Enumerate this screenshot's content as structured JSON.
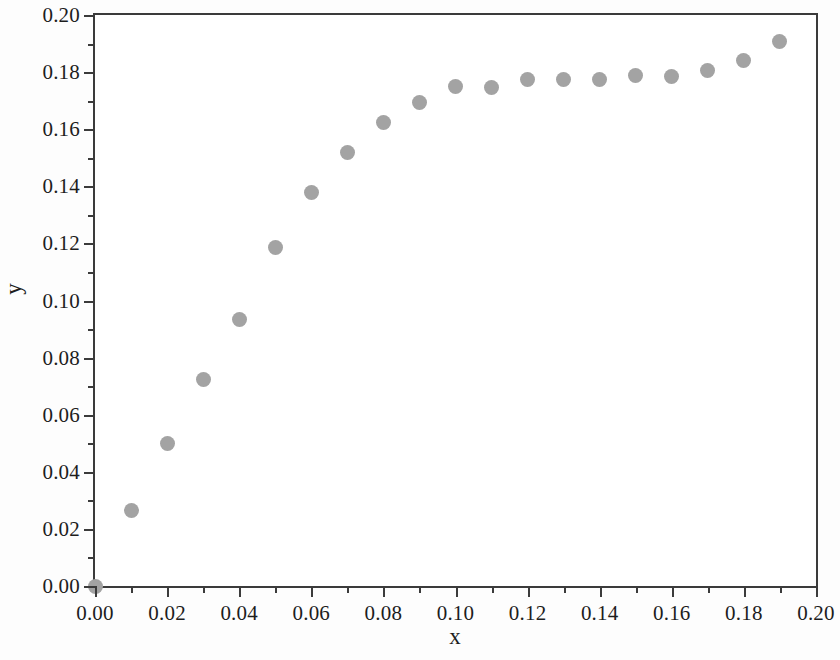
{
  "figure": {
    "background_color": "#ffffff",
    "frame_color": "#3b3b3b",
    "marker_color": "#a3a3a3"
  },
  "axis_title_x": "x",
  "axis_title_y": "y",
  "scan_artifact_text": "",
  "chart_data": {
    "type": "scatter",
    "title": "",
    "xlabel": "x",
    "ylabel": "y",
    "xlim": [
      0.0,
      0.2
    ],
    "ylim": [
      0.0,
      0.2
    ],
    "grid": false,
    "legend": "none",
    "marker": "filled-circle",
    "marker_color": "#a3a3a3",
    "x_major_ticks": [
      0.0,
      0.02,
      0.04,
      0.06,
      0.08,
      0.1,
      0.12,
      0.14,
      0.16,
      0.18,
      0.2
    ],
    "x_major_tick_labels": [
      "0.00",
      "0.02",
      "0.04",
      "0.06",
      "0.08",
      "0.10",
      "0.12",
      "0.14",
      "0.16",
      "0.18",
      "0.20"
    ],
    "x_minor_ticks": [
      0.01,
      0.03,
      0.05,
      0.07,
      0.09,
      0.11,
      0.13,
      0.15,
      0.17,
      0.19
    ],
    "y_major_ticks": [
      0.0,
      0.02,
      0.04,
      0.06,
      0.08,
      0.1,
      0.12,
      0.14,
      0.16,
      0.18,
      0.2
    ],
    "y_major_tick_labels": [
      "0.00",
      "0.02",
      "0.04",
      "0.06",
      "0.08",
      "0.10",
      "0.12",
      "0.14",
      "0.16",
      "0.18",
      "0.20"
    ],
    "y_minor_ticks": [
      0.01,
      0.03,
      0.05,
      0.07,
      0.09,
      0.11,
      0.13,
      0.15,
      0.17,
      0.19
    ],
    "x": [
      0.0,
      0.01,
      0.02,
      0.03,
      0.04,
      0.05,
      0.06,
      0.07,
      0.08,
      0.09,
      0.1,
      0.11,
      0.12,
      0.13,
      0.14,
      0.15,
      0.16,
      0.17,
      0.18,
      0.19
    ],
    "y": [
      0.0,
      0.0265,
      0.0498,
      0.0722,
      0.0935,
      0.1186,
      0.1377,
      0.152,
      0.1625,
      0.1692,
      0.1748,
      0.1746,
      0.1773,
      0.1775,
      0.1773,
      0.1787,
      0.1786,
      0.1805,
      0.1842,
      0.1906
    ]
  }
}
